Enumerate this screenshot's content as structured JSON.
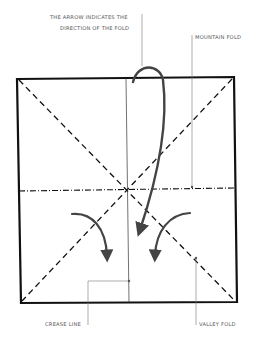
{
  "labels": {
    "arrow_line1": "THE ARROW INDICATES THE",
    "arrow_line2": "DIRECTION OF THE FOLD",
    "mountain": "MOUNTAIN FOLD",
    "crease": "CREASE LINE",
    "valley": "VALLEY FOLD"
  },
  "colors": {
    "line": "#111111",
    "leader": "#777777",
    "arrow": "#444444"
  }
}
